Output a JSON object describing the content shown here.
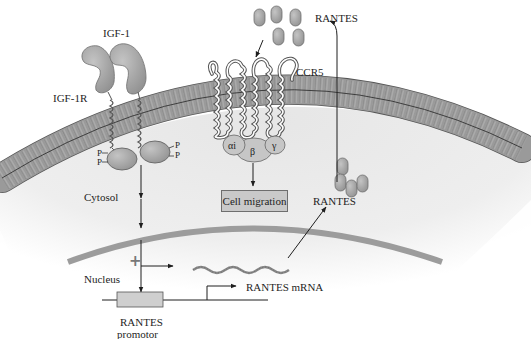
{
  "diagram": {
    "colors": {
      "background": "#ffffff",
      "cytosol": "#ececec",
      "membrane_lipid": "#9a9a9a",
      "membrane_outline": "#555555",
      "protein": "#a8a8a8",
      "nuclear_envelope": "#9c9c9c",
      "box_fill": "#c9c9c9",
      "text": "#1e1e1e"
    },
    "labels": {
      "igf1": "IGF-1",
      "igf1r": "IGF-1R",
      "rantes_top": "RANTES",
      "ccr5": "CCR5",
      "g_alpha": "αi",
      "g_beta": "β",
      "g_gamma": "γ",
      "cytosol": "Cytosol",
      "cell_migration": "Cell migration",
      "rantes_mid": "RANTES",
      "nucleus": "Nucleus",
      "plus": "+",
      "rantes_mrna": "RANTES mRNA",
      "promoter_line1": "RANTES",
      "promoter_line2": "promotor",
      "phospho": "P"
    },
    "nodes": [
      {
        "id": "igf1",
        "label": "IGF-1",
        "type": "ligand"
      },
      {
        "id": "igf1r",
        "label": "IGF-1R",
        "type": "receptor"
      },
      {
        "id": "rantes_promoter",
        "label": "RANTES promotor",
        "type": "gene"
      },
      {
        "id": "rantes_mrna",
        "label": "RANTES mRNA",
        "type": "transcript"
      },
      {
        "id": "rantes",
        "label": "RANTES",
        "type": "chemokine"
      },
      {
        "id": "ccr5",
        "label": "CCR5",
        "type": "receptor"
      },
      {
        "id": "g_protein",
        "label": "αi β γ",
        "type": "g-protein"
      },
      {
        "id": "cell_migration",
        "label": "Cell migration",
        "type": "outcome"
      }
    ],
    "edges": [
      {
        "from": "igf1r",
        "to": "rantes_promoter",
        "label": "+"
      },
      {
        "from": "rantes_promoter",
        "to": "rantes_mrna"
      },
      {
        "from": "rantes_mrna",
        "to": "rantes"
      },
      {
        "from": "rantes",
        "to": "ccr5"
      },
      {
        "from": "ccr5",
        "to": "cell_migration"
      }
    ],
    "regions": [
      "Cytosol",
      "Nucleus"
    ]
  }
}
